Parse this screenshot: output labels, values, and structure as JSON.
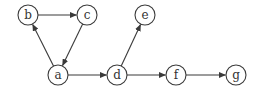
{
  "graph": {
    "type": "directed",
    "nodes": [
      {
        "id": "a",
        "label": "a"
      },
      {
        "id": "b",
        "label": "b"
      },
      {
        "id": "c",
        "label": "c"
      },
      {
        "id": "d",
        "label": "d"
      },
      {
        "id": "e",
        "label": "e"
      },
      {
        "id": "f",
        "label": "f"
      },
      {
        "id": "g",
        "label": "g"
      }
    ],
    "edges": [
      {
        "from": "a",
        "to": "b"
      },
      {
        "from": "b",
        "to": "c"
      },
      {
        "from": "c",
        "to": "a"
      },
      {
        "from": "a",
        "to": "d"
      },
      {
        "from": "d",
        "to": "e"
      },
      {
        "from": "d",
        "to": "f"
      },
      {
        "from": "f",
        "to": "g"
      }
    ]
  },
  "colors": {
    "stroke": "#3a3a3a",
    "label": "#333333",
    "background": "#ffffff"
  }
}
